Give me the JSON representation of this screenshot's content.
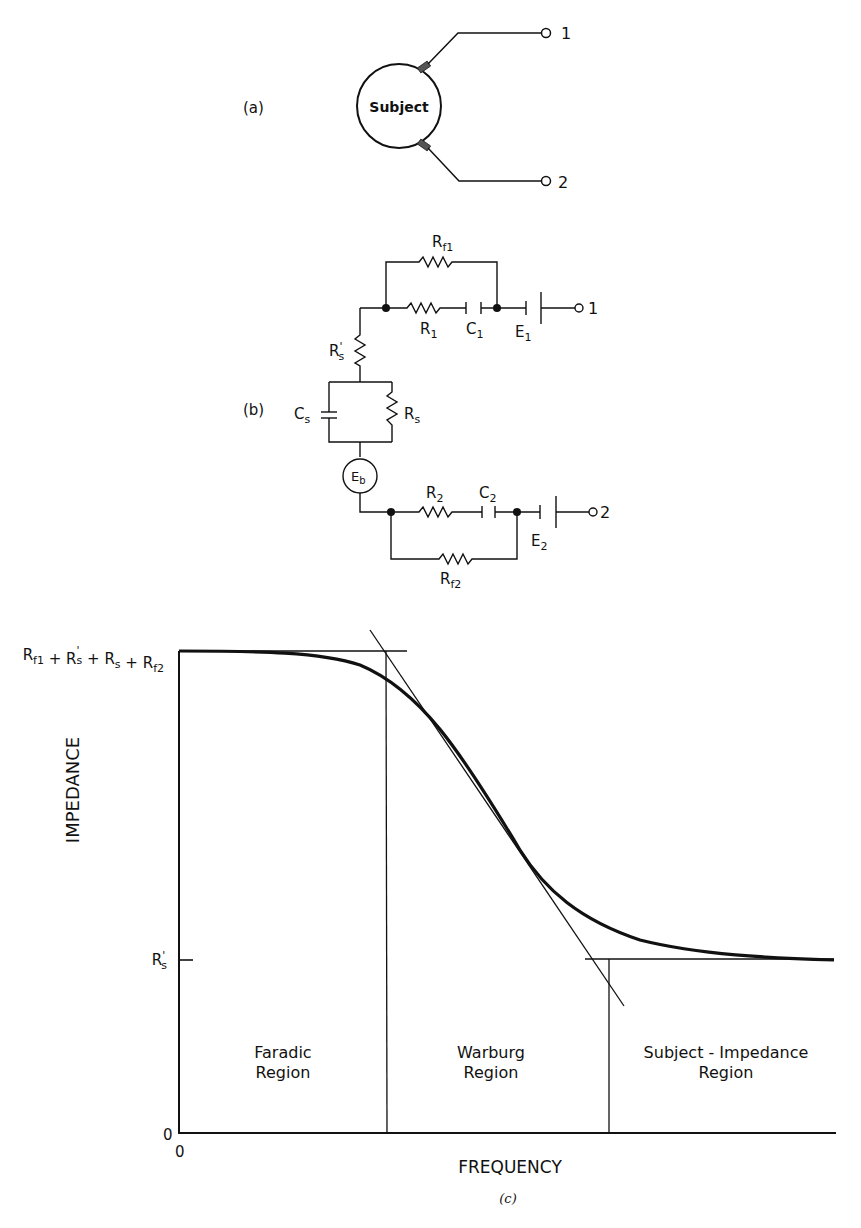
{
  "panel_a": {
    "label": "(a)",
    "subject": "Subject",
    "terminal_1": "1",
    "terminal_2": "2"
  },
  "panel_b": {
    "label": "(b)",
    "components": {
      "Rf1": {
        "main": "R",
        "sub": "f1"
      },
      "R1": {
        "main": "R",
        "sub": "1"
      },
      "C1": {
        "main": "C",
        "sub": "1"
      },
      "E1": {
        "main": "E",
        "sub": "1"
      },
      "Rs_prime": {
        "main": "R",
        "sub": "s",
        "prime": "'"
      },
      "Cs": {
        "main": "C",
        "sub": "s"
      },
      "Rs": {
        "main": "R",
        "sub": "s"
      },
      "Eb": {
        "main": "E",
        "sub": "b"
      },
      "R2": {
        "main": "R",
        "sub": "2"
      },
      "C2": {
        "main": "C",
        "sub": "2"
      },
      "E2": {
        "main": "E",
        "sub": "2"
      },
      "Rf2": {
        "main": "R",
        "sub": "f2"
      }
    },
    "terminal_1": "1",
    "terminal_2": "2"
  },
  "panel_c": {
    "caption": "(c)",
    "ylabel": "IMPEDANCE",
    "xlabel": "FREQUENCY",
    "y_origin": "0",
    "x_origin": "0",
    "y_top_label": {
      "parts": [
        "R",
        "f1",
        "+",
        "R",
        "s",
        "+",
        "R",
        "s",
        "+",
        "R",
        "f2"
      ]
    },
    "y_low_label": {
      "main": "R",
      "sub": "s",
      "prime": "'"
    },
    "regions": [
      {
        "line1": "Faradic",
        "line2": "Region"
      },
      {
        "line1": "Warburg",
        "line2": "Region"
      },
      {
        "line1": "Subject - Impedance",
        "line2": "Region"
      }
    ]
  },
  "chart_data": {
    "type": "line",
    "title": "",
    "xlabel": "FREQUENCY",
    "ylabel": "IMPEDANCE",
    "y_ticks": [
      "0",
      "R's",
      "Rf1 + R's + Rs + Rf2"
    ],
    "x_ticks": [
      "0"
    ],
    "grid": false,
    "legend": null,
    "series": [
      {
        "name": "Impedance vs frequency (sigmoidal decline)",
        "x_relative": [
          0.0,
          0.15,
          0.25,
          0.31,
          0.35,
          0.42,
          0.5,
          0.55,
          0.6,
          0.65,
          0.75,
          0.9,
          1.0
        ],
        "y_relative": [
          1.0,
          0.995,
          0.97,
          0.92,
          0.87,
          0.72,
          0.5,
          0.35,
          0.25,
          0.17,
          0.08,
          0.02,
          0.0
        ]
      }
    ],
    "annotations": [
      "Horizontal asymptote at Rf1 + R's + Rs + Rf2 (low frequency)",
      "Horizontal asymptote at R's (high frequency)",
      "Tangent line through inflection point of the curve",
      "Vertical dividers at tangent/asymptote intersections separate regions",
      "Faradic Region",
      "Warburg Region",
      "Subject-Impedance Region"
    ]
  }
}
